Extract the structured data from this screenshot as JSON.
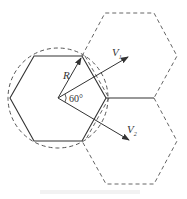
{
  "diagram": {
    "type": "hexagonal-cell-geometry",
    "colors": {
      "stroke": "#333333",
      "dashed": "#666666",
      "background": "#ffffff"
    },
    "center": [
      58,
      98
    ],
    "circle_radius": 50,
    "cells": [
      {
        "name": "center-cell",
        "style": "solid",
        "points": [
          [
            10,
            98
          ],
          [
            34,
            56
          ],
          [
            82,
            56
          ],
          [
            106,
            98
          ],
          [
            82,
            141
          ],
          [
            34,
            141
          ]
        ]
      },
      {
        "name": "upper-right-cell",
        "style": "dashed",
        "points": [
          [
            82,
            56
          ],
          [
            105,
            13
          ],
          [
            154,
            13
          ],
          [
            177,
            56
          ],
          [
            154,
            98
          ],
          [
            106,
            98
          ]
        ]
      },
      {
        "name": "lower-right-cell",
        "style": "dashed",
        "points": [
          [
            106,
            98
          ],
          [
            154,
            98
          ],
          [
            177,
            141
          ],
          [
            154,
            184
          ],
          [
            106,
            184
          ],
          [
            82,
            141
          ]
        ]
      }
    ],
    "shared_edge": [
      [
        106,
        98
      ],
      [
        154,
        98
      ]
    ],
    "vectors": [
      {
        "name": "R",
        "from": [
          58,
          98
        ],
        "to": [
          82,
          56
        ]
      },
      {
        "name": "V1",
        "from": [
          58,
          98
        ],
        "to": [
          128,
          57
        ]
      },
      {
        "name": "V2",
        "from": [
          58,
          98
        ],
        "to": [
          129,
          140
        ]
      }
    ],
    "labels": {
      "radius": "R",
      "v1": "V",
      "v1_sub": "1",
      "v2": "V",
      "v2_sub": "2",
      "angle": "60°"
    }
  }
}
